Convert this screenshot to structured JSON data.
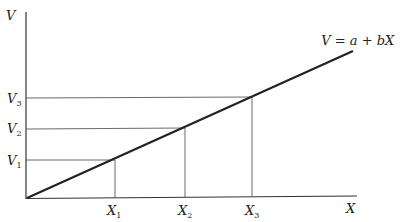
{
  "diagram": {
    "y_axis_label": "V",
    "x_axis_label": "X",
    "equation": {
      "lhs": "V",
      "eq": " = ",
      "a": "a",
      "plus": " + ",
      "b": "b",
      "x": "X"
    },
    "y_ticks": [
      {
        "base": "V",
        "sub": "1"
      },
      {
        "base": "V",
        "sub": "2"
      },
      {
        "base": "V",
        "sub": "3"
      }
    ],
    "x_ticks": [
      {
        "base": "X",
        "sub": "1"
      },
      {
        "base": "X",
        "sub": "2"
      },
      {
        "base": "X",
        "sub": "3"
      }
    ],
    "colors": {
      "axis": "#333333",
      "line": "#222222",
      "guides": "#444444"
    }
  },
  "chart_data": {
    "type": "line",
    "title": "",
    "xlabel": "X",
    "ylabel": "V",
    "series": [
      {
        "name": "V = a + bX",
        "x": [
          0,
          1,
          2,
          3,
          4.05
        ],
        "y": [
          0,
          1,
          2,
          3,
          4.05
        ]
      }
    ],
    "annotations": [
      "X1",
      "X2",
      "X3",
      "V1",
      "V2",
      "V3"
    ],
    "grid": false
  }
}
